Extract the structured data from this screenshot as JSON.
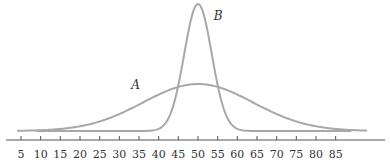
{
  "chart_data": {
    "type": "line",
    "title": "",
    "xlabel": "",
    "ylabel": "",
    "x_ticks": [
      5,
      10,
      15,
      20,
      25,
      30,
      35,
      40,
      45,
      50,
      55,
      60,
      65,
      70,
      75,
      80,
      85
    ],
    "xlim": [
      0,
      95
    ],
    "grid": false,
    "legend": "inline labels",
    "series": [
      {
        "name": "A",
        "description": "wide normal curve, mean 50, large spread",
        "mean": 50,
        "sd": 14,
        "relative_peak": 0.37
      },
      {
        "name": "B",
        "description": "narrow normal curve, mean 50, small spread",
        "mean": 50,
        "sd": 3.5,
        "relative_peak": 1.0
      }
    ],
    "annotations": [
      {
        "text": "A",
        "x": 33,
        "y_rel": 0.33
      },
      {
        "text": "B",
        "x": 54,
        "y_rel": 0.97
      }
    ],
    "colors": {
      "curves": "#a8a8a8",
      "axis": "#555555"
    }
  }
}
